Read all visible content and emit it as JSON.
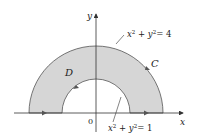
{
  "diagram": {
    "region_label": "D",
    "curve_label": "C",
    "axes": {
      "x_label": "x",
      "y_label": "y",
      "origin_label": "0"
    },
    "outer_circle": {
      "equation": "x² + y² = 4",
      "lhs_x": "x",
      "lhs_y": "y",
      "exp": "2",
      "rhs": "= 4",
      "radius": 2
    },
    "inner_circle": {
      "equation": "x² + y² = 1",
      "lhs_x": "x",
      "lhs_y": "y",
      "exp": "2",
      "rhs": "= 1",
      "radius": 1
    },
    "colors": {
      "region_fill": "#d6d6d6",
      "stroke": "#333333",
      "axis": "#333333"
    }
  }
}
